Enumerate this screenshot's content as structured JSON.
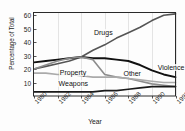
{
  "chart_data": {
    "type": "line",
    "title": "",
    "xlabel": "Year",
    "ylabel": "Percentage of Total",
    "xlim": [
      1980,
      1992
    ],
    "ylim": [
      0,
      62
    ],
    "ytick_values": [
      10,
      20,
      30,
      40,
      50,
      60
    ],
    "ytick_labels": [
      "10",
      "20",
      "30",
      "40",
      "50",
      "60"
    ],
    "xtick_values": [
      1980,
      1982,
      1984,
      1986,
      1988,
      1990,
      1992
    ],
    "xtick_labels": [
      "1980",
      "1982",
      "1984",
      "1986",
      "1988",
      "1990",
      "1992"
    ],
    "grid": "vertical-only",
    "legend": "inline-series-labels",
    "x": [
      1980,
      1981,
      1982,
      1983,
      1984,
      1985,
      1986,
      1987,
      1988,
      1989,
      1990,
      1991,
      1992
    ],
    "series": [
      {
        "name": "Drugs",
        "color": "#555555",
        "width": 1.6,
        "values": [
          20,
          22,
          24,
          26,
          29,
          34,
          38,
          43,
          47,
          51,
          56,
          60,
          61
        ],
        "label_x": 1985.0,
        "label_y": 47
      },
      {
        "name": "Violence",
        "color": "#111111",
        "width": 1.9,
        "values": [
          25,
          26,
          27,
          28,
          29,
          28,
          28,
          27,
          26,
          23,
          19,
          16,
          14
        ],
        "label_x": 1990.4,
        "label_y": 21
      },
      {
        "name": "Property",
        "color": "#8c8c8c",
        "width": 1.6,
        "values": [
          20,
          23,
          26,
          28,
          29,
          27,
          16,
          14,
          13,
          11,
          9,
          8,
          7
        ],
        "label_x": 1982.1,
        "label_y": 17
      },
      {
        "name": "Other",
        "color": "#aaaaaa",
        "width": 1.6,
        "values": [
          17,
          17,
          16,
          16,
          15,
          14,
          14,
          14,
          13,
          12,
          11,
          10,
          10
        ],
        "label_x": 1987.5,
        "label_y": 16
      },
      {
        "name": "Weapons",
        "color": "#1a1a1a",
        "width": 1.7,
        "values": [
          3,
          3,
          3,
          3,
          3,
          3,
          4,
          4,
          5,
          6,
          7,
          7,
          7
        ],
        "label_x": 1982.0,
        "label_y": 9
      }
    ]
  },
  "axes": {
    "y_axis_title": "Percentage of Total",
    "x_axis_title": "Year"
  }
}
